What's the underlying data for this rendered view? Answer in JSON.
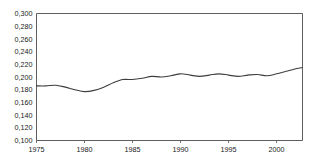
{
  "chart_data": {
    "type": "line",
    "title": "",
    "subtitle": "",
    "xlabel": "",
    "ylabel": "",
    "xlim": [
      1975,
      2002.7
    ],
    "ylim": [
      0.1,
      0.3
    ],
    "grid": false,
    "legend": null,
    "decimal_separator": ",",
    "y_ticks": [
      0.3,
      0.28,
      0.26,
      0.24,
      0.22,
      0.2,
      0.18,
      0.16,
      0.14,
      0.12,
      0.1
    ],
    "y_tick_labels": [
      "0,300",
      "0,280",
      "0,260",
      "0,240",
      "0,220",
      "0,200",
      "0,180",
      "0,160",
      "0,140",
      "0,120",
      "0,100"
    ],
    "x_ticks": [
      1975,
      1980,
      1985,
      1990,
      1995,
      2000
    ],
    "x_tick_labels": [
      "1975",
      "1980",
      "1985",
      "1990",
      "1995",
      "2000"
    ],
    "series": [
      {
        "name": "series-1",
        "color": "#3d3d3d",
        "x": [
          1975,
          1976,
          1977,
          1978,
          1979,
          1980,
          1981,
          1982,
          1983,
          1984,
          1985,
          1986,
          1987,
          1988,
          1989,
          1990,
          1991,
          1992,
          1993,
          1994,
          1995,
          1996,
          1997,
          1998,
          1999,
          2000,
          2001,
          2002,
          2002.7
        ],
        "values": [
          0.186,
          0.186,
          0.187,
          0.184,
          0.18,
          0.177,
          0.179,
          0.184,
          0.191,
          0.196,
          0.196,
          0.198,
          0.201,
          0.2,
          0.202,
          0.205,
          0.203,
          0.201,
          0.203,
          0.205,
          0.203,
          0.201,
          0.203,
          0.204,
          0.202,
          0.205,
          0.209,
          0.213,
          0.215
        ]
      }
    ]
  }
}
